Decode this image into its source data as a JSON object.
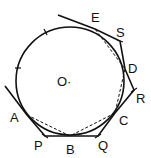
{
  "labels": {
    "O": "O·",
    "E": "E",
    "S": "S",
    "D": "D",
    "R": "R",
    "C": "C",
    "Q": "Q",
    "B": "B",
    "P": "P",
    "A": "A"
  },
  "colors": {
    "stroke": "#111111",
    "background": "#ffffff"
  }
}
